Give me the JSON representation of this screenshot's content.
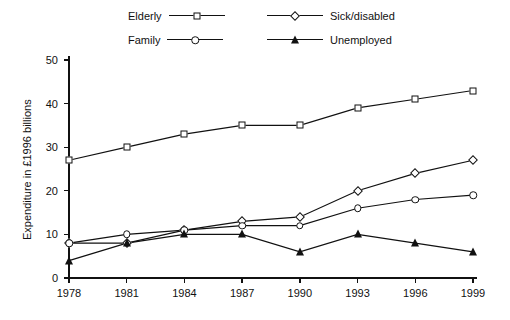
{
  "chart_data": {
    "type": "line",
    "title": "",
    "xlabel": "",
    "ylabel": "Expenditure in £1996 billions",
    "categories": [
      "1978",
      "1981",
      "1984",
      "1987",
      "1990",
      "1993",
      "1996",
      "1999"
    ],
    "x": [
      1978,
      1981,
      1984,
      1987,
      1990,
      1993,
      1996,
      1999
    ],
    "ylim": [
      0,
      50
    ],
    "yticks": [
      0,
      10,
      20,
      30,
      40,
      50
    ],
    "ytick_labels": [
      "0",
      "10",
      "20",
      "30",
      "40",
      "50"
    ],
    "grid": false,
    "legend_position": "top",
    "series": [
      {
        "name": "Elderly",
        "marker": "square-open",
        "color": "#111111",
        "values": [
          27,
          30,
          33,
          35,
          35,
          39,
          41,
          43
        ]
      },
      {
        "name": "Sick/disabled",
        "marker": "diamond-open",
        "color": "#111111",
        "values": [
          8,
          8,
          11,
          13,
          14,
          20,
          24,
          27
        ]
      },
      {
        "name": "Family",
        "marker": "circle-open",
        "color": "#111111",
        "values": [
          8,
          10,
          11,
          12,
          12,
          16,
          18,
          19
        ]
      },
      {
        "name": "Unemployed",
        "marker": "triangle-filled",
        "color": "#111111",
        "values": [
          4,
          8,
          10,
          10,
          6,
          10,
          8,
          6
        ]
      }
    ]
  },
  "legend": {
    "entries": [
      {
        "label": "Elderly",
        "marker": "square-open",
        "side": "left",
        "row": 0
      },
      {
        "label": "Sick/disabled",
        "marker": "diamond-open",
        "side": "right",
        "row": 0
      },
      {
        "label": "Family",
        "marker": "circle-open",
        "side": "left",
        "row": 1
      },
      {
        "label": "Unemployed",
        "marker": "triangle-filled",
        "side": "right",
        "row": 1
      }
    ]
  },
  "axes": {
    "y_axis_title": "Expenditure in £1996 billions",
    "y_tick_labels": [
      "50",
      "40",
      "30",
      "20",
      "10",
      "0"
    ],
    "x_tick_labels": [
      "1978",
      "1981",
      "1984",
      "1987",
      "1990",
      "1993",
      "1996",
      "1999"
    ]
  }
}
